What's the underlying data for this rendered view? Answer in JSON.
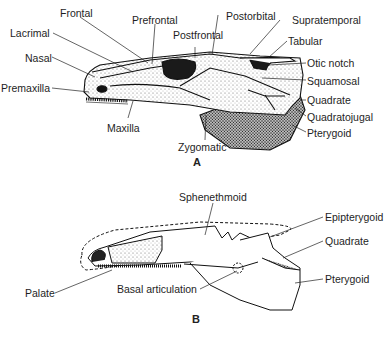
{
  "figure": {
    "panels": [
      {
        "id": "A",
        "label": "A",
        "labels": {
          "frontal": "Frontal",
          "prefrontal": "Prefrontal",
          "postorbital": "Postorbital",
          "supratemporal": "Supratemporal",
          "lacrimal": "Lacrimal",
          "postfrontal": "Postfrontal",
          "tabular": "Tabular",
          "nasal": "Nasal",
          "otic_notch": "Otic notch",
          "premaxilla": "Premaxilla",
          "squamosal": "Squamosal",
          "quadrate": "Quadrate",
          "quadratojugal": "Quadratojugal",
          "maxilla": "Maxilla",
          "pterygoid": "Pterygoid",
          "zygomatic": "Zygomatic"
        }
      },
      {
        "id": "B",
        "label": "B",
        "labels": {
          "sphenethmoid": "Sphenethmoid",
          "epipterygoid": "Epipterygoid",
          "quadrate": "Quadrate",
          "pterygoid": "Pterygoid",
          "palate": "Palate",
          "basal_articulation": "Basal articulation"
        }
      }
    ]
  }
}
